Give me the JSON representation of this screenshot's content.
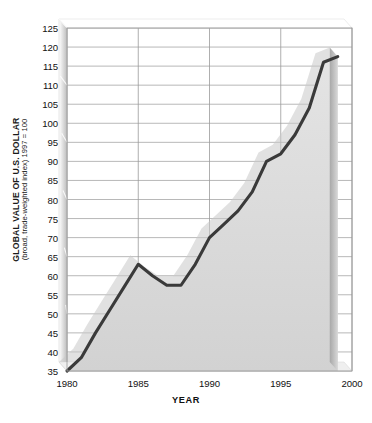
{
  "chart_data": {
    "type": "area",
    "title": "",
    "xlabel": "YEAR",
    "ylabel": "GLOBAL VALUE OF U.S. DOLLAR",
    "ylabel_sub": "(broad, trade-weighted index) 1997 = 100",
    "xlim": [
      1980,
      2000
    ],
    "ylim": [
      35,
      125
    ],
    "grid": true,
    "legend": "none",
    "y_ticks": [
      35,
      40,
      45,
      50,
      55,
      60,
      65,
      70,
      75,
      80,
      85,
      90,
      95,
      100,
      105,
      110,
      115,
      120,
      125
    ],
    "x_ticks": [
      1980,
      1985,
      1990,
      1995,
      2000
    ],
    "x_minor_step": 1,
    "x": [
      1980,
      1981,
      1982,
      1983,
      1984,
      1985,
      1986,
      1987,
      1988,
      1989,
      1990,
      1991,
      1992,
      1993,
      1994,
      1995,
      1996,
      1997,
      1998,
      1999
    ],
    "values": [
      35,
      38.5,
      45,
      51,
      57,
      63,
      60,
      57.5,
      57.5,
      63,
      70,
      73.5,
      77,
      82,
      90,
      92,
      97,
      104,
      116,
      117.5
    ],
    "series": [
      {
        "name": "Global value of U.S. dollar",
        "values": [
          35,
          38.5,
          45,
          51,
          57,
          63,
          60,
          57.5,
          57.5,
          63,
          70,
          73.5,
          77,
          82,
          90,
          92,
          97,
          104,
          116,
          117.5
        ]
      }
    ],
    "line_color": "#3a3a3a",
    "fill_color": "#dcdcdc",
    "grid_color": "#9a9a9a",
    "background_color": "#ffffff"
  },
  "axes": {
    "y_title_main": "GLOBAL VALUE OF U.S. DOLLAR",
    "y_title_sub": "(broad, trade-weighted index) 1997 = 100",
    "x_title": "YEAR",
    "y_tick_labels": [
      "125",
      "120",
      "115",
      "110",
      "105",
      "100",
      "95",
      "90",
      "85",
      "80",
      "75",
      "70",
      "65",
      "60",
      "55",
      "50",
      "45",
      "40",
      "35"
    ],
    "x_tick_labels": [
      "1980",
      "1985",
      "1990",
      "1995",
      "2000"
    ]
  }
}
